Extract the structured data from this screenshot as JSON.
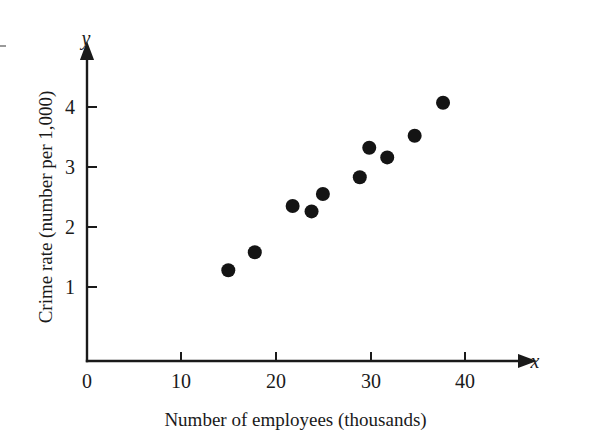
{
  "chart_data": {
    "type": "scatter",
    "title": "",
    "xlabel": "Number of employees (thousands)",
    "ylabel": "Crime rate (number per 1,000)",
    "x_axis_variable": "x",
    "y_axis_variable": "y",
    "xlim": [
      0,
      45
    ],
    "ylim": [
      0.7,
      4.6
    ],
    "xticks": [
      0,
      10,
      20,
      30,
      40
    ],
    "yticks": [
      1,
      2,
      3,
      4
    ],
    "xtick_labels": [
      "0",
      "10",
      "20",
      "30",
      "40"
    ],
    "ytick_labels": [
      "1",
      "2",
      "3",
      "4"
    ],
    "grid": false,
    "legend": null,
    "axis_break_below_y": 1,
    "marker": "filled-circle",
    "marker_color": "#141414",
    "points": [
      {
        "x": 15.0,
        "y": 1.28
      },
      {
        "x": 17.8,
        "y": 1.58
      },
      {
        "x": 21.8,
        "y": 2.35
      },
      {
        "x": 23.8,
        "y": 2.26
      },
      {
        "x": 25.0,
        "y": 2.55
      },
      {
        "x": 28.9,
        "y": 2.83
      },
      {
        "x": 29.9,
        "y": 3.32
      },
      {
        "x": 31.8,
        "y": 3.16
      },
      {
        "x": 34.7,
        "y": 3.52
      },
      {
        "x": 37.7,
        "y": 4.07
      }
    ]
  },
  "axes": {
    "x_label_text": "Number of employees (thousands)",
    "y_label_text": "Crime rate (number per 1,000)",
    "x_var_text": "x",
    "y_var_text": "y"
  },
  "ticks": {
    "x": [
      {
        "label": "0",
        "value": 0
      },
      {
        "label": "10",
        "value": 10
      },
      {
        "label": "20",
        "value": 20
      },
      {
        "label": "30",
        "value": 30
      },
      {
        "label": "40",
        "value": 40
      }
    ],
    "y": [
      {
        "label": "1",
        "value": 1
      },
      {
        "label": "2",
        "value": 2
      },
      {
        "label": "3",
        "value": 3
      },
      {
        "label": "4",
        "value": 4
      }
    ]
  },
  "colors": {
    "ink": "#1a1a1a",
    "marker": "#141414",
    "background": "#ffffff"
  }
}
